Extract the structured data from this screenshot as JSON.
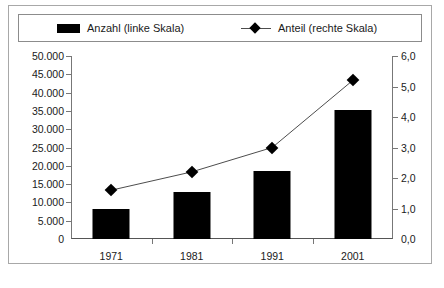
{
  "chart_data": {
    "type": "bar",
    "title": "",
    "subtitle": "",
    "xlabel": "",
    "ylabel": "",
    "categories": [
      "1971",
      "1981",
      "1991",
      "2001"
    ],
    "legend_position": "top",
    "grid": false,
    "series": [
      {
        "name": "Anzahl (linke Skala)",
        "type": "bar",
        "axis": "left",
        "color": "#000000",
        "values": [
          8300,
          12900,
          18600,
          35200
        ]
      },
      {
        "name": "Anteil (rechte Skala)",
        "type": "line",
        "axis": "right",
        "color": "#000000",
        "marker": "diamond",
        "values": [
          1.6,
          2.2,
          3.0,
          5.2
        ]
      }
    ],
    "left_axis": {
      "label": "",
      "ylim": [
        0,
        50000
      ],
      "tick_step": 5000,
      "tick_labels": [
        "0",
        "5.000",
        "10.000",
        "15.000",
        "20.000",
        "25.000",
        "30.000",
        "35.000",
        "40.000",
        "45.000",
        "50.000"
      ],
      "tick_values": [
        0,
        5000,
        10000,
        15000,
        20000,
        25000,
        30000,
        35000,
        40000,
        45000,
        50000
      ]
    },
    "right_axis": {
      "label": "",
      "ylim": [
        0,
        6
      ],
      "tick_step": 1,
      "tick_labels": [
        "0,0",
        "1,0",
        "2,0",
        "3,0",
        "4,0",
        "5,0",
        "6,0"
      ],
      "tick_values": [
        0,
        1,
        2,
        3,
        4,
        5,
        6
      ]
    }
  },
  "legend": {
    "entries": [
      {
        "label": "Anzahl (linke Skala)",
        "marker": "filled-rectangle"
      },
      {
        "label": "Anteil (rechte Skala)",
        "marker": "line-with-diamond"
      }
    ]
  },
  "caption": {
    "text": ""
  }
}
